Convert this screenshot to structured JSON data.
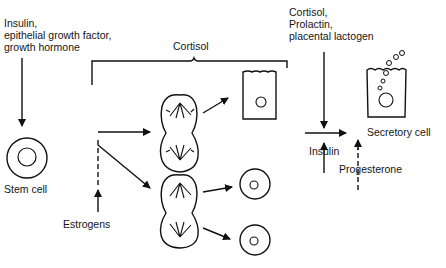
{
  "labels": {
    "left_hormones": "Insulin,\nepithelial growth factor,\ngrowth hormone",
    "cortisol_top": "Cortisol",
    "right_hormones": "Cortisol,\nProlactin,\nplacental lactogen",
    "stem_cell": "Stem cell",
    "estrogens": "Estrogens",
    "insulin": "Insulin",
    "progesterone": "Progesterone",
    "secretory_cell": "Secretory cell"
  },
  "colors": {
    "ink": "#111111",
    "background": "#ffffff"
  }
}
